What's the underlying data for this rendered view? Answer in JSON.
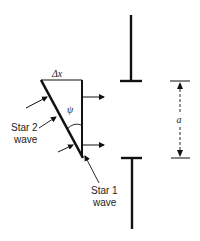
{
  "diagram": {
    "labels": {
      "delta_x": "Δx",
      "psi": "ψ",
      "a": "a",
      "star2_line1": "Star 2",
      "star2_line2": "wave",
      "star1_line1": "Star 1",
      "star1_line2": "wave"
    },
    "elements": {
      "wedge": "triangular wavefront wedge with hypotenuse tilted by angle ψ",
      "slit": "two opaque screen bars separated by aperture a",
      "arrows": "outgoing wave direction arrows to the right"
    },
    "colors": {
      "ink": "#111111",
      "background": "#ffffff"
    }
  }
}
